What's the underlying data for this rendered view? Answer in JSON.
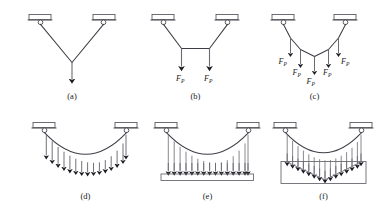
{
  "figure": {
    "background_color": "#ffffff",
    "line_color": "#3d3d46",
    "secondary_line_color": "#6a6a72",
    "width": 376,
    "height": 212,
    "panels": [
      {
        "id": "a",
        "caption": "(a)",
        "description": "Cable with single concentrated load at midspan",
        "load_labels": []
      },
      {
        "id": "b",
        "caption": "(b)",
        "description": "Cable with two concentrated loads",
        "load_labels": [
          "F",
          "F"
        ],
        "load_subscripts": [
          "P",
          "P"
        ]
      },
      {
        "id": "c",
        "caption": "(c)",
        "description": "Cable with five concentrated loads",
        "load_labels": [
          "F",
          "F",
          "F",
          "F",
          "F"
        ],
        "load_subscripts": [
          "P",
          "P",
          "P",
          "P",
          "P"
        ]
      },
      {
        "id": "d",
        "caption": "(d)",
        "description": "Cable with uniformly distributed load along cable",
        "load_labels": []
      },
      {
        "id": "e",
        "caption": "(e)",
        "description": "Cable with hangers supporting horizontal deck",
        "load_labels": []
      },
      {
        "id": "f",
        "caption": "(f)",
        "description": "Cable with hangers supporting deck with earth fill",
        "load_labels": []
      }
    ],
    "force_symbol": "F",
    "force_subscript": "P"
  }
}
